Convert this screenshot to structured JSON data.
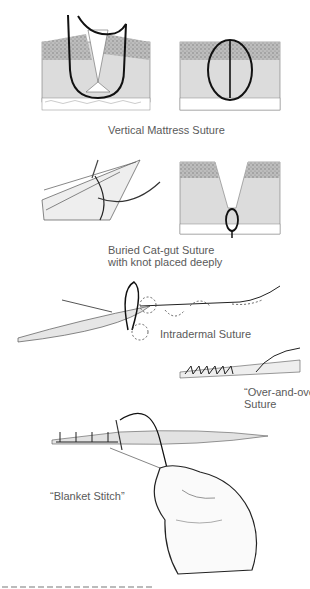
{
  "figures": [
    {
      "id": "vertical-mattress",
      "label": "Vertical Mattress Suture"
    },
    {
      "id": "buried-catgut",
      "label_lines": [
        "Buried Cat-gut Suture",
        "with knot placed deeply"
      ]
    },
    {
      "id": "intradermal",
      "label": "Intradermal Suture"
    },
    {
      "id": "over-and-over",
      "label_lines": [
        "“Over-and-over”",
        "Suture"
      ]
    },
    {
      "id": "blanket-stitch",
      "label": "“Blanket Stitch”"
    }
  ],
  "colors": {
    "epidermis": "#b8b8b8",
    "dermis": "#dcdcdc",
    "fat": "#f2f2f2",
    "thread": "#111111"
  }
}
